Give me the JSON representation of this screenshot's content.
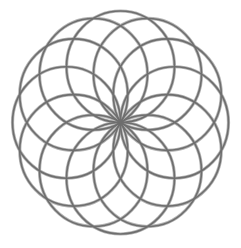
{
  "figure": {
    "name": "circle-rosette",
    "width": 241,
    "height": 248,
    "background": "#ffffff",
    "center": {
      "x": 120.5,
      "y": 122.5
    },
    "outer_radius_x": 108,
    "outer_radius_y": 111.5,
    "circle_count": 12,
    "start_angle_deg": 0,
    "angle_step_deg": 30,
    "stroke": {
      "color": "#6e6e6e",
      "halo_color": "#b4b4b4",
      "width": 1.6,
      "halo_width": 3.2
    }
  }
}
